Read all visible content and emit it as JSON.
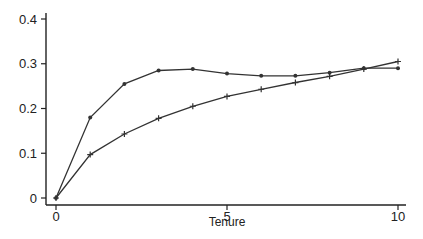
{
  "chart_data": {
    "type": "line",
    "title": "",
    "xlabel": "Tenure",
    "ylabel": "",
    "xlim": [
      0,
      10
    ],
    "ylim": [
      0,
      0.4
    ],
    "grid": false,
    "legend": null,
    "x": [
      0,
      1,
      2,
      3,
      4,
      5,
      6,
      7,
      8,
      9,
      10
    ],
    "x_ticks": [
      "0",
      "5",
      "10"
    ],
    "y_ticks": [
      "0",
      "0.1",
      "0.2",
      "0.3",
      "0.4"
    ],
    "series": [
      {
        "name": "series-dot",
        "marker": "dot",
        "values": [
          0,
          0.18,
          0.255,
          0.285,
          0.288,
          0.278,
          0.273,
          0.273,
          0.28,
          0.29,
          0.29
        ]
      },
      {
        "name": "series-plus",
        "marker": "plus",
        "values": [
          0,
          0.097,
          0.143,
          0.178,
          0.205,
          0.227,
          0.243,
          0.258,
          0.272,
          0.288,
          0.305
        ]
      }
    ]
  },
  "colors": {
    "line": "#333333",
    "axis": "#222222"
  }
}
